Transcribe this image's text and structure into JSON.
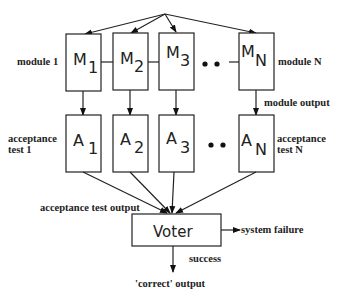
{
  "diagram": {
    "modules": [
      {
        "letter": "M",
        "sub": "1"
      },
      {
        "letter": "M",
        "sub": "2"
      },
      {
        "letter": "M",
        "sub": "3"
      },
      {
        "letter": "M",
        "sub": "N"
      }
    ],
    "acceptance_tests": [
      {
        "letter": "A",
        "sub": "1"
      },
      {
        "letter": "A",
        "sub": "2"
      },
      {
        "letter": "A",
        "sub": "3"
      },
      {
        "letter": "A",
        "sub": "N"
      }
    ],
    "ellipsis": "• •",
    "voter": "Voter",
    "labels": {
      "module_1": "module 1",
      "module_n": "module N",
      "module_output": "module output",
      "acceptance_test_1_line1": "acceptance",
      "acceptance_test_1_line2": "test 1",
      "acceptance_test_n_line1": "acceptance",
      "acceptance_test_n_line2": "test N",
      "acceptance_test_output": "acceptance test output",
      "system_failure": "system failure",
      "success": "success",
      "correct_output": "'correct' output"
    }
  }
}
